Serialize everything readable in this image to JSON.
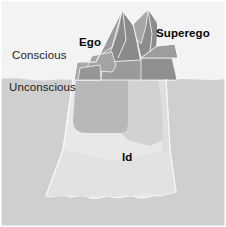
{
  "figure": {
    "width": 226,
    "height": 227,
    "background_color": "#ffffff"
  },
  "water": {
    "sky_color": "#f3f3f3",
    "sea_color": "#cfcfcf",
    "waterline_y": 79,
    "label_above": "Conscious",
    "label_below": "Unconscious"
  },
  "labels": {
    "conscious": "Conscious",
    "unconscious": "Unconscious",
    "ego": "Ego",
    "superego": "Superego",
    "id": "Id"
  },
  "iceberg": {
    "above_water_color": "#9a9a9a",
    "above_water_shadow_color": "#8a8a8a",
    "above_water_highlight_color": "#b4b4b4",
    "below_water_color": "#e8e8e8",
    "below_water_dark_color": "#b8b8b8",
    "edge_color": "#f7f7f7",
    "parts": [
      {
        "name": "superego-peak",
        "label": "Superego",
        "region": "above-water-right"
      },
      {
        "name": "ego-peak",
        "label": "Ego",
        "region": "above-water-left"
      },
      {
        "name": "id-mass",
        "label": "Id",
        "region": "below-water"
      }
    ]
  },
  "colors": {
    "text": "#151515",
    "sky": "#f3f3f3",
    "sea": "#cfcfcf",
    "ice_light": "#e8e8e8",
    "ice_mid": "#b8b8b8",
    "ice_dark": "#8a8a8a"
  }
}
